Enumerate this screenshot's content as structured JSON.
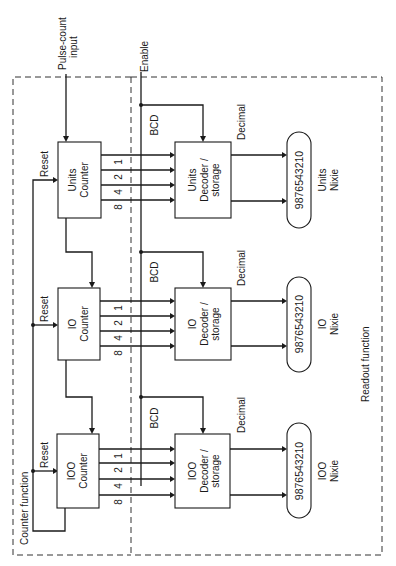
{
  "diagram": {
    "orientation": "rotated 90 degrees counter-clockwise",
    "inputs": {
      "pulse_count": "Pulse-count",
      "pulse_count_line2": "input",
      "enable": "Enable"
    },
    "regions": {
      "counter": "Counter function",
      "readout": "Readout function"
    },
    "labels": {
      "reset": "Reset",
      "bcd": "BCD",
      "decimal": "Decimal",
      "bits": [
        "1",
        "2",
        "4",
        "8"
      ]
    },
    "stages": [
      {
        "name": "Units",
        "counter_line1": "Units",
        "counter_line2": "Counter",
        "decoder_line1": "Units",
        "decoder_line2": "Decoder /",
        "decoder_line3": "storage",
        "nixie_digits": "9876543210",
        "nixie_line1": "Units",
        "nixie_line2": "Nixie"
      },
      {
        "name": "10",
        "counter_line1": "IO",
        "counter_line2": "Counter",
        "decoder_line1": "IO",
        "decoder_line2": "Decoder /",
        "decoder_line3": "storage",
        "nixie_digits": "9876543210",
        "nixie_line1": "IO",
        "nixie_line2": "Nixie"
      },
      {
        "name": "100",
        "counter_line1": "IOO",
        "counter_line2": "Counter",
        "decoder_line1": "IOO",
        "decoder_line2": "Decoder /",
        "decoder_line3": "storage",
        "nixie_digits": "9876543210",
        "nixie_line1": "IOO",
        "nixie_line2": "Nixie"
      }
    ],
    "colors": {
      "line": "#1a1a1a",
      "background": "#ffffff"
    }
  }
}
